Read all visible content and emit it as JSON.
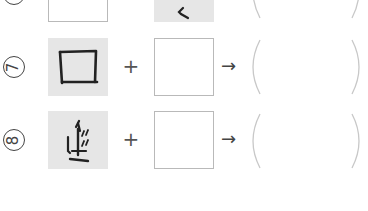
{
  "rows": [
    {
      "number_label": "6",
      "plus": "+",
      "arrow": "→",
      "left_box": {
        "style": "white",
        "content": ""
      },
      "right_box": {
        "style": "gray",
        "content": "stroke-fragment"
      },
      "answer": ""
    },
    {
      "number_label": "7",
      "plus": "+",
      "arrow": "→",
      "left_box": {
        "style": "gray",
        "content": "口 (mouth radical)"
      },
      "right_box": {
        "style": "white",
        "content": ""
      },
      "answer": ""
    },
    {
      "number_label": "8",
      "plus": "+",
      "arrow": "→",
      "left_box": {
        "style": "gray",
        "content": "kanji component"
      },
      "right_box": {
        "style": "white",
        "content": ""
      },
      "answer": ""
    }
  ],
  "colors": {
    "gray_box": "#e6e6e6",
    "box_border": "#b9b9b9",
    "paren": "#c8c8c8",
    "ink": "#222222"
  }
}
